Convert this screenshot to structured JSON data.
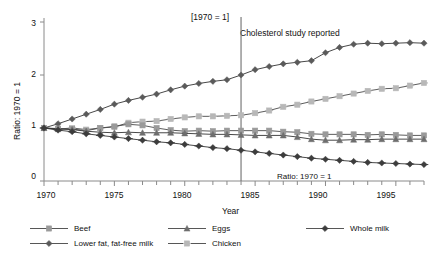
{
  "chart_data": {
    "type": "line",
    "title": "[1970 = 1]",
    "xlabel": "Year",
    "ylabel": "Ratio: 1970 = 1",
    "xlim": [
      1970,
      1997
    ],
    "ylim": [
      0,
      3
    ],
    "yticks": [
      "0",
      "1",
      "2",
      "3"
    ],
    "ytick_values": [
      0,
      1,
      2,
      3
    ],
    "xticks": [
      "1970",
      "1975",
      "1980",
      "1985",
      "1990",
      "1995"
    ],
    "xtick_values": [
      1970,
      1975,
      1980,
      1985,
      1990,
      1995
    ],
    "grid": false,
    "legend_position": "bottom",
    "x": [
      1970,
      1971,
      1972,
      1973,
      1974,
      1975,
      1976,
      1977,
      1978,
      1979,
      1980,
      1981,
      1982,
      1983,
      1984,
      1985,
      1986,
      1987,
      1988,
      1989,
      1990,
      1991,
      1992,
      1993,
      1994,
      1995,
      1996,
      1997
    ],
    "series": [
      {
        "name": "Lower fat, fat-free milk",
        "marker": "diamond",
        "color": "#5a5a5a",
        "values": [
          1.0,
          1.08,
          1.17,
          1.26,
          1.35,
          1.45,
          1.52,
          1.58,
          1.64,
          1.72,
          1.79,
          1.84,
          1.88,
          1.91,
          2.0,
          2.1,
          2.16,
          2.21,
          2.24,
          2.27,
          2.42,
          2.52,
          2.58,
          2.6,
          2.59,
          2.6,
          2.61,
          2.6
        ]
      },
      {
        "name": "Chicken",
        "marker": "x-square",
        "color": "#b8b8b8",
        "values": [
          1.0,
          0.98,
          1.0,
          0.97,
          1.0,
          1.02,
          1.1,
          1.12,
          1.13,
          1.17,
          1.2,
          1.22,
          1.22,
          1.23,
          1.24,
          1.28,
          1.33,
          1.4,
          1.44,
          1.5,
          1.55,
          1.6,
          1.65,
          1.7,
          1.74,
          1.75,
          1.8,
          1.85
        ]
      },
      {
        "name": "Beef",
        "marker": "square",
        "color": "#9a9a9a",
        "values": [
          1.0,
          0.99,
          0.98,
          0.95,
          1.0,
          1.03,
          1.07,
          1.05,
          1.0,
          0.96,
          0.94,
          0.95,
          0.94,
          0.95,
          0.95,
          0.95,
          0.95,
          0.93,
          0.92,
          0.89,
          0.88,
          0.88,
          0.88,
          0.87,
          0.88,
          0.87,
          0.86,
          0.86
        ]
      },
      {
        "name": "Eggs",
        "marker": "triangle",
        "color": "#6e6e6e",
        "values": [
          1.0,
          0.98,
          0.97,
          0.94,
          0.92,
          0.91,
          0.92,
          0.91,
          0.91,
          0.91,
          0.9,
          0.89,
          0.88,
          0.88,
          0.87,
          0.86,
          0.86,
          0.86,
          0.83,
          0.79,
          0.77,
          0.77,
          0.78,
          0.78,
          0.79,
          0.79,
          0.79,
          0.79
        ]
      },
      {
        "name": "Whole milk",
        "marker": "plus-diamond",
        "color": "#3d3d3d",
        "values": [
          1.0,
          0.96,
          0.93,
          0.89,
          0.86,
          0.83,
          0.8,
          0.77,
          0.74,
          0.72,
          0.69,
          0.66,
          0.63,
          0.61,
          0.58,
          0.55,
          0.52,
          0.49,
          0.46,
          0.43,
          0.41,
          0.39,
          0.37,
          0.35,
          0.34,
          0.33,
          0.32,
          0.31
        ]
      }
    ],
    "annotations": [
      {
        "name": "event-line",
        "text": "Cholesterol study reported",
        "x": 1984,
        "type": "vline"
      },
      {
        "name": "inplot-ratio-label",
        "text": "Ratio: 1970 = 1"
      }
    ]
  },
  "legend": {
    "items": [
      {
        "label": "Beef",
        "marker": "square",
        "color": "#9a9a9a"
      },
      {
        "label": "Eggs",
        "marker": "triangle",
        "color": "#6e6e6e"
      },
      {
        "label": "Whole milk",
        "marker": "plus-diamond",
        "color": "#3d3d3d"
      },
      {
        "label": "Lower fat, fat-free milk",
        "marker": "diamond",
        "color": "#5a5a5a"
      },
      {
        "label": "Chicken",
        "marker": "x-square",
        "color": "#b8b8b8"
      }
    ]
  },
  "axis_color": "#8a8a8a"
}
